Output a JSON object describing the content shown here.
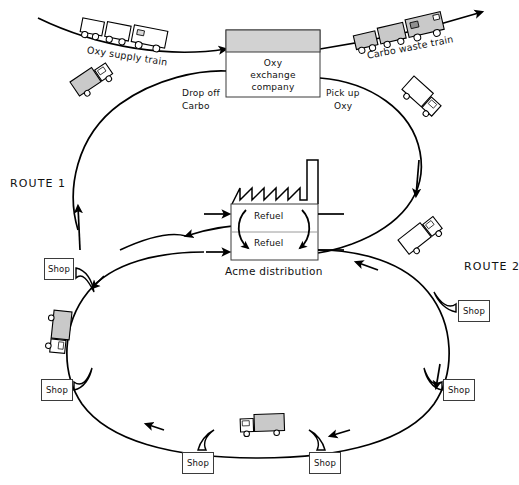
{
  "diagram": {
    "title_fragment": "",
    "colors": {
      "ink": "#111111",
      "line": "#000000",
      "grey_fill": "#c9c9c9",
      "light_grey_fill": "#d7d7d7",
      "white_fill": "#ffffff",
      "border": "#3b3b3b",
      "background": "#ffffff"
    }
  },
  "rail": {
    "supply_train_label": "Oxy supply train",
    "waste_train_label": "Carbo waste train"
  },
  "exchange": {
    "line1": "Oxy",
    "line2": "exchange",
    "line3": "company"
  },
  "notes": {
    "drop_off_line1": "Drop off",
    "drop_off_line2": "Carbo",
    "pick_up_line1": "Pick up",
    "pick_up_line2": "Oxy"
  },
  "routes": {
    "route1_label": "ROUTE 1",
    "route2_label": "ROUTE 2"
  },
  "factory": {
    "name": "Acme distribution",
    "refuel_upper": "Refuel",
    "refuel_lower": "Refuel"
  },
  "shops": [
    {
      "label": "Shop",
      "x": 44,
      "y": 258,
      "w": 30,
      "h": 22
    },
    {
      "label": "Shop",
      "x": 41,
      "y": 379,
      "w": 32,
      "h": 22
    },
    {
      "label": "Shop",
      "x": 182,
      "y": 452,
      "w": 32,
      "h": 22
    },
    {
      "label": "Shop",
      "x": 309,
      "y": 452,
      "w": 32,
      "h": 22
    },
    {
      "label": "Shop",
      "x": 443,
      "y": 379,
      "w": 32,
      "h": 22
    },
    {
      "label": "Shop",
      "x": 458,
      "y": 300,
      "w": 32,
      "h": 22
    }
  ],
  "icons": {
    "supply_train": "train-icon",
    "waste_train": "train-icon",
    "truck": "truck-icon",
    "factory": "factory-icon",
    "shop": "shop-icon"
  }
}
